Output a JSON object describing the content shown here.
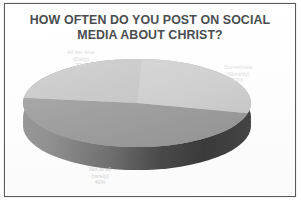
{
  "chart_data": {
    "type": "pie",
    "title": "HOW OFTEN DO YOU POST ON SOCIAL MEDIA ABOUT CHRIST?",
    "title_lines": [
      "HOW OFTEN DO YOU POST ON SOCIAL",
      "MEDIA ABOUT CHRIST?"
    ],
    "categories": [
      "All the time (Daily)",
      "Sometimes (Monthly)",
      "Not at all (rarely)"
    ],
    "values": [
      23,
      31,
      46
    ],
    "value_unit": "%",
    "legend": "none",
    "grid": false,
    "three_d": true,
    "slice_colors": [
      "#c6c6c6",
      "#cfcfcf",
      "#9d9d9d"
    ],
    "slices": [
      {
        "name": "All the time (Daily)",
        "label_lines": [
          "All the time",
          "(Daily)",
          "23%"
        ],
        "value": 23,
        "value_text": "23%",
        "color": "#c6c6c6"
      },
      {
        "name": "Sometimes (Monthly)",
        "label_lines": [
          "Sometimes",
          "(Monthly)",
          "31%"
        ],
        "value": 31,
        "value_text": "31%",
        "color": "#cfcfcf"
      },
      {
        "name": "Not at all (rarely)",
        "label_lines": [
          "Not at all",
          "(rarely)",
          "46%"
        ],
        "value": 46,
        "value_text": "46%",
        "color": "#9d9d9d"
      }
    ]
  },
  "style": {
    "border_color": "#57595b",
    "title_color": "#4a4d50",
    "background": "#ffffff"
  }
}
